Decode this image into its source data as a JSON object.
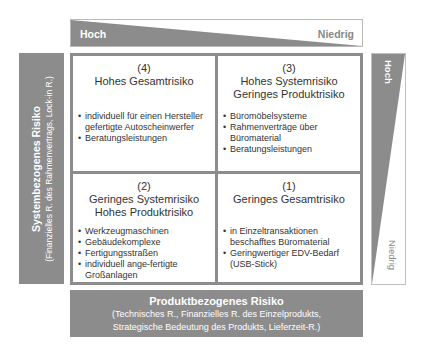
{
  "top_axis": {
    "high_label": "Hoch",
    "low_label": "Niedrig"
  },
  "left_axis": {
    "title": "Systembezogenes Risiko",
    "subtitle": "(Finanzielles R. des Rahmenvertrags, Lock-in R.)"
  },
  "right_axis": {
    "high_label": "Hoch",
    "low_label": "Niedrig"
  },
  "bottom_axis": {
    "title": "Produktbezogenes Risiko",
    "subtitle_line1": "(Technisches R., Finanzielles R. des Einzelprodukts,",
    "subtitle_line2": "Strategische Bedeutung des Produkts, Lieferzeit-R.)"
  },
  "quadrants": {
    "q4": {
      "number": "(4)",
      "title_line1": "Hohes Gesamtrisiko",
      "title_line2": "",
      "items": [
        "individuell für einen Hersteller gefertigte Autoscheinwerfer",
        "Beratungsleistungen"
      ]
    },
    "q3": {
      "number": "(3)",
      "title_line1": "Hohes Systemrisiko",
      "title_line2": "Geringes Produktrisiko",
      "items": [
        "Büromöbelsysteme",
        "Rahmenverträge über Büromaterial",
        "Beratungsleistungen"
      ]
    },
    "q2": {
      "number": "(2)",
      "title_line1": "Geringes Systemrisiko",
      "title_line2": "Hohes Produktrisiko",
      "items": [
        "Werkzeugmaschinen",
        "Gebäudekomplexe",
        "Fertigungsstraßen",
        "individuell ange-fertigte Großanlagen"
      ]
    },
    "q1": {
      "number": "(1)",
      "title_line1": "Geringes Gesamtrisiko",
      "title_line2": "",
      "items": [
        "in Einzeltransaktionen beschafftes Büromaterial",
        "Geringwertiger EDV-Bedarf (USB-Stick)"
      ]
    }
  },
  "colors": {
    "panel_gray": "#8c8c8c",
    "border_gray": "#8c8c8c",
    "text_dark": "#333333",
    "label_light": "#888888"
  }
}
